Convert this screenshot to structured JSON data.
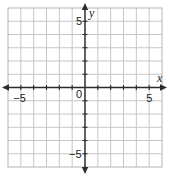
{
  "diagram": {
    "type": "coordinate-plane",
    "grid": {
      "x_min": -6,
      "x_max": 6,
      "y_min": -6,
      "y_max": 6,
      "step": 1,
      "gridline_color": "#c6c6c6",
      "axis_color": "#2b2b2b"
    },
    "axes": {
      "x_label": "x",
      "y_label": "y",
      "arrows": "both-ends"
    },
    "x_tick_labels": [
      {
        "value": -5,
        "text": "−5"
      },
      {
        "value": 5,
        "text": "5"
      }
    ],
    "y_tick_labels": [
      {
        "value": 5,
        "text": "5"
      },
      {
        "value": -5,
        "text": "−5"
      }
    ],
    "origin_label": "0"
  }
}
